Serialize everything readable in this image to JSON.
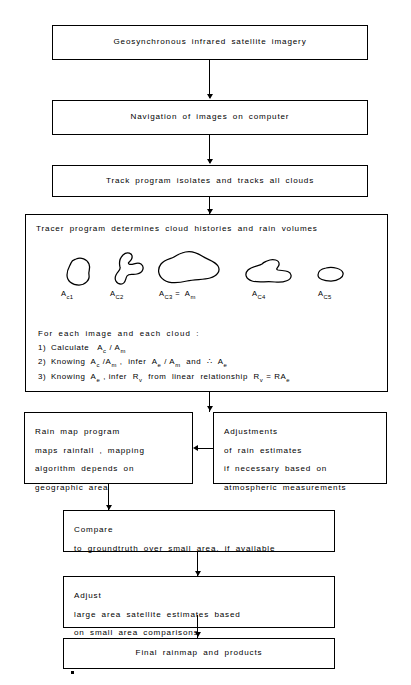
{
  "diagram": {
    "background_color": "#ffffff",
    "line_color": "#000000"
  },
  "nodes": {
    "satellite_imagery": "Geosynchronous  infrared  satellite  imagery",
    "navigation": "Navigation  of  images  on  computer",
    "track_program": "Track  program  isolates  and  tracks  all  clouds",
    "tracer_heading": "Tracer  program  determines  cloud  histories  and  rain  volumes",
    "rain_map_program": "Rain map program\nmaps rainfall , mapping\nalgorithm  depends on\ngeographic  area",
    "adjustments": "Adjustments\nof rain  estimates\nif necessary based on\natmospheric  measurements",
    "compare": "Compare\nto groundtruth  over  small  area, if  available",
    "adjust": "Adjust\nlarge area satellite  estimates  based\non  small area  comparisons",
    "final_rainmap": "Final  rainmap  and   products"
  },
  "clouds": [
    {
      "id": "cloud-1",
      "label_base": "A",
      "label_sub": "c1"
    },
    {
      "id": "cloud-2",
      "label_base": "A",
      "label_sub": "C2"
    },
    {
      "id": "cloud-3",
      "label_base": "A",
      "label_sub": "C3",
      "label_suffix": "=  A",
      "label_suffix_sub": "m"
    },
    {
      "id": "cloud-4",
      "label_base": "A",
      "label_sub": "C4"
    },
    {
      "id": "cloud-5",
      "label_base": "A",
      "label_sub": "C5"
    }
  ],
  "formula": {
    "intro": "For  each  image  and  each  cloud :",
    "lines": [
      {
        "num": "1)",
        "text_parts": [
          "Calculate   A",
          "c",
          " / A",
          "m",
          ""
        ]
      },
      {
        "num": "2)",
        "text_parts": [
          "Knowing  A",
          "c",
          " /A",
          "m",
          " ,  infer  A",
          "e",
          " / A",
          "m",
          "  and  ∴  A",
          "e",
          ""
        ]
      },
      {
        "num": "3)",
        "text_parts": [
          "Knowing  A",
          "e",
          " , infer  R",
          "v",
          "  from  linear  relationship  R",
          "v",
          " = RA",
          "e",
          ""
        ]
      }
    ],
    "line1_plain": "Calculate",
    "line2_plain": "Knowing",
    "line3_plain": "Knowing"
  },
  "edges": [
    {
      "from": "satellite_imagery",
      "to": "navigation",
      "direction": "down"
    },
    {
      "from": "navigation",
      "to": "track_program",
      "direction": "down"
    },
    {
      "from": "track_program",
      "to": "tracer",
      "direction": "down"
    },
    {
      "from": "tracer",
      "to": "rain_map_program",
      "direction": "down"
    },
    {
      "from": "adjustments",
      "to": "rain_map_program",
      "direction": "left"
    },
    {
      "from": "rain_map_program",
      "to": "compare",
      "direction": "down"
    },
    {
      "from": "compare",
      "to": "adjust",
      "direction": "down"
    },
    {
      "from": "adjust",
      "to": "final_rainmap",
      "direction": "down"
    }
  ]
}
